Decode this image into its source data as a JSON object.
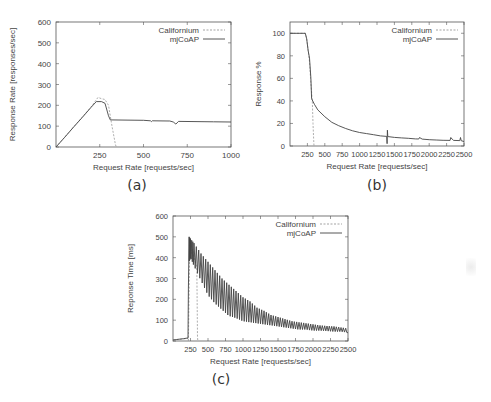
{
  "figure": {
    "captions": [
      "(a)",
      "(b)",
      "(c)"
    ]
  },
  "chart_data": [
    {
      "id": "a",
      "type": "line",
      "title": "",
      "xlabel": "Request Rate [requests/sec]",
      "ylabel": "Response Rate [responses/sec]",
      "xlim": [
        0,
        1000
      ],
      "ylim": [
        0,
        600
      ],
      "xticks": [
        250,
        500,
        750,
        1000
      ],
      "yticks": [
        0,
        100,
        200,
        300,
        400,
        500,
        600
      ],
      "grid": false,
      "legend_position": "top-right",
      "series": [
        {
          "name": "Californium",
          "style": "dashed",
          "x": [
            0,
            50,
            100,
            150,
            200,
            240,
            260,
            280,
            300,
            320,
            340,
            345
          ],
          "y": [
            0,
            48,
            96,
            144,
            192,
            238,
            232,
            228,
            200,
            100,
            10,
            0
          ]
        },
        {
          "name": "mjCoAP",
          "style": "solid",
          "x": [
            0,
            50,
            100,
            150,
            200,
            230,
            260,
            280,
            300,
            310,
            400,
            500,
            540,
            545,
            550,
            650,
            670,
            685,
            700,
            800,
            900,
            1000
          ],
          "y": [
            0,
            47,
            95,
            142,
            190,
            218,
            218,
            210,
            150,
            130,
            129,
            128,
            126,
            122,
            126,
            125,
            120,
            110,
            123,
            122,
            121,
            120
          ]
        }
      ]
    },
    {
      "id": "b",
      "type": "line",
      "title": "",
      "xlabel": "Request Rate [requests/sec]",
      "ylabel": "Response %",
      "xlim": [
        0,
        2500
      ],
      "ylim": [
        0,
        110
      ],
      "xticks": [
        250,
        500,
        750,
        1000,
        1250,
        1500,
        1750,
        2000,
        2250,
        2500
      ],
      "yticks": [
        0,
        20,
        40,
        60,
        80,
        100
      ],
      "grid": false,
      "legend_position": "top-right",
      "series": [
        {
          "name": "Californium",
          "style": "dashed",
          "x": [
            0,
            220,
            240,
            260,
            280,
            300,
            320,
            330,
            340,
            345
          ],
          "y": [
            100,
            100,
            95,
            85,
            75,
            55,
            40,
            20,
            5,
            0
          ]
        },
        {
          "name": "mjCoAP",
          "style": "solid",
          "x": [
            0,
            220,
            240,
            260,
            280,
            300,
            310,
            350,
            400,
            500,
            600,
            700,
            800,
            900,
            1000,
            1100,
            1200,
            1300,
            1390,
            1395,
            1400,
            1405,
            1410,
            1500,
            1600,
            1700,
            1800,
            1850,
            1860,
            1900,
            2000,
            2100,
            2200,
            2300,
            2310,
            2330,
            2350,
            2400,
            2440,
            2450,
            2460,
            2500
          ],
          "y": [
            100,
            100,
            95,
            85,
            78,
            60,
            42,
            37,
            32,
            26,
            21,
            18,
            15.5,
            13.5,
            12,
            11,
            10,
            9,
            8.5,
            2,
            14,
            8.4,
            8.3,
            7.6,
            7.2,
            6.8,
            6.3,
            6.2,
            7.5,
            6.1,
            5.6,
            5.3,
            5.1,
            5.0,
            7.5,
            6.0,
            5.0,
            4.9,
            4.8,
            7.5,
            4.7,
            4.0
          ]
        }
      ]
    },
    {
      "id": "c",
      "type": "line",
      "title": "",
      "xlabel": "Request Rate [requests/sec]",
      "ylabel": "Reponse Time [ms]",
      "xlim": [
        0,
        2500
      ],
      "ylim": [
        0,
        600
      ],
      "xticks": [
        250,
        500,
        750,
        1000,
        1250,
        1500,
        1750,
        2000,
        2250,
        2500
      ],
      "yticks": [
        0,
        100,
        200,
        300,
        400,
        500,
        600
      ],
      "grid": false,
      "legend_position": "top-right",
      "series": [
        {
          "name": "Californium",
          "style": "dashed",
          "x": [
            0,
            200,
            215,
            220,
            240,
            260,
            280,
            300,
            320,
            340,
            350,
            355
          ],
          "y": [
            5,
            12,
            12,
            0,
            480,
            420,
            440,
            400,
            380,
            360,
            20,
            0
          ]
        },
        {
          "name": "mjCoAP",
          "style": "solid",
          "envelope": {
            "x": [
              230,
              250,
              300,
              400,
              500,
              600,
              700,
              800,
              900,
              1000,
              1100,
              1200,
              1300,
              1400,
              1500,
              1600,
              1700,
              1800,
              1900,
              2000,
              2100,
              2200,
              2300,
              2400,
              2500
            ],
            "high": [
              500,
              490,
              470,
              420,
              380,
              340,
              300,
              270,
              240,
              210,
              190,
              160,
              145,
              125,
              115,
              105,
              95,
              90,
              85,
              80,
              75,
              72,
              70,
              65,
              60
            ],
            "low": [
              380,
              400,
              360,
              290,
              220,
              180,
              150,
              120,
              110,
              95,
              90,
              85,
              80,
              75,
              70,
              65,
              60,
              55,
              55,
              50,
              50,
              48,
              45,
              45,
              40
            ]
          },
          "x": [
            0,
            50,
            100,
            150,
            200,
            215,
            220,
            230
          ],
          "y": [
            5,
            7,
            9,
            11,
            14,
            15,
            250,
            500
          ]
        }
      ]
    }
  ]
}
